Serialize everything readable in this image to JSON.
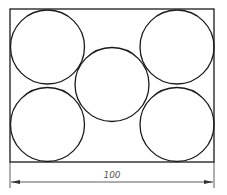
{
  "diagram": {
    "shapes": {
      "rectangle": {
        "label": "outer-rectangle"
      },
      "circles": [
        {
          "name": "top-left-circle"
        },
        {
          "name": "bottom-left-circle"
        },
        {
          "name": "center-circle"
        },
        {
          "name": "top-right-circle"
        },
        {
          "name": "bottom-right-circle"
        }
      ]
    },
    "dimension": {
      "value": "100",
      "orientation": "horizontal",
      "measures": "rectangle width"
    },
    "colors": {
      "stroke": "#1a1a1a",
      "dimension_stroke": "#333333",
      "dimension_text": "#555555",
      "background": "#ffffff"
    }
  }
}
